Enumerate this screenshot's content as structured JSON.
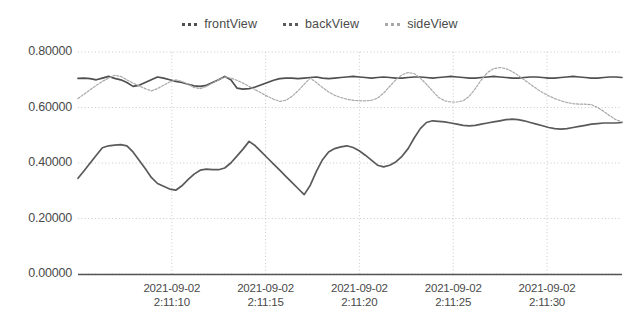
{
  "chart_data": {
    "type": "line",
    "title": "",
    "xlabel": "",
    "ylabel": "",
    "ylim": [
      0.0,
      0.8
    ],
    "grid": true,
    "legend_position": "top-center",
    "ytick_labels": [
      "0.80000",
      "0.60000",
      "0.40000",
      "0.20000",
      "0.00000"
    ],
    "ytick_values": [
      0.8,
      0.6,
      0.4,
      0.2,
      0.0
    ],
    "xtick_labels": [
      {
        "date": "2021-09-02",
        "time": "2:11:10"
      },
      {
        "date": "2021-09-02",
        "time": "2:11:15"
      },
      {
        "date": "2021-09-02",
        "time": "2:11:20"
      },
      {
        "date": "2021-09-02",
        "time": "2:11:25"
      },
      {
        "date": "2021-09-02",
        "time": "2:11:30"
      }
    ],
    "xtick_values": [
      5,
      10,
      15,
      20,
      25
    ],
    "xlim": [
      0,
      29
    ],
    "series": [
      {
        "name": "frontView",
        "color": "#4f4f4f",
        "values": [
          0.705,
          0.706,
          0.704,
          0.7,
          0.706,
          0.712,
          0.705,
          0.7,
          0.69,
          0.676,
          0.68,
          0.69,
          0.7,
          0.71,
          0.706,
          0.7,
          0.694,
          0.69,
          0.684,
          0.678,
          0.676,
          0.68,
          0.69,
          0.7,
          0.712,
          0.7,
          0.67,
          0.666,
          0.668,
          0.674,
          0.682,
          0.69,
          0.698,
          0.704,
          0.706,
          0.706,
          0.704,
          0.706,
          0.708,
          0.71,
          0.706,
          0.704,
          0.706,
          0.708,
          0.71,
          0.712,
          0.71,
          0.708,
          0.706,
          0.708,
          0.71,
          0.708,
          0.706,
          0.706,
          0.708,
          0.71,
          0.71,
          0.708,
          0.706,
          0.708
        ]
      },
      {
        "name": "backView",
        "color": "#5a5a5a",
        "values": [
          0.345,
          0.372,
          0.4,
          0.428,
          0.455,
          0.462,
          0.464,
          0.466,
          0.462,
          0.44,
          0.41,
          0.38,
          0.348,
          0.326,
          0.316,
          0.306,
          0.302,
          0.318,
          0.34,
          0.36,
          0.374,
          0.378,
          0.376,
          0.376,
          0.382,
          0.4,
          0.425,
          0.45,
          0.478,
          0.462,
          0.44,
          0.418,
          0.396,
          0.374,
          0.352,
          0.33,
          0.308,
          0.286,
          0.32,
          0.37,
          0.412,
          0.44,
          0.452,
          0.458,
          0.462,
          0.456,
          0.444,
          0.428,
          0.41,
          0.392,
          0.386,
          0.392,
          0.404,
          0.424,
          0.452,
          0.49,
          0.524,
          0.546,
          0.552,
          0.55
        ]
      },
      {
        "name": "sideView",
        "color": "#a8a8a8",
        "values": [
          0.632,
          0.648,
          0.664,
          0.68,
          0.694,
          0.706,
          0.716,
          0.712,
          0.7,
          0.688,
          0.678,
          0.668,
          0.66,
          0.668,
          0.68,
          0.692,
          0.7,
          0.694,
          0.684,
          0.672,
          0.668,
          0.676,
          0.688,
          0.7,
          0.71,
          0.706,
          0.698,
          0.688,
          0.676,
          0.664,
          0.652,
          0.64,
          0.63,
          0.622,
          0.626,
          0.64,
          0.66,
          0.684,
          0.706,
          0.69,
          0.672,
          0.656,
          0.644,
          0.636,
          0.63,
          0.626,
          0.624,
          0.624,
          0.626,
          0.634,
          0.652,
          0.676,
          0.7,
          0.718,
          0.726,
          0.722,
          0.706,
          0.684,
          0.66,
          0.636
        ]
      }
    ],
    "series_tail": {
      "note": "second half continuation",
      "frontView": [
        0.71,
        0.712,
        0.71,
        0.708,
        0.706,
        0.706,
        0.708,
        0.71,
        0.712,
        0.71,
        0.708,
        0.706,
        0.706,
        0.708,
        0.71,
        0.71,
        0.708,
        0.706,
        0.706,
        0.708,
        0.71,
        0.712,
        0.71,
        0.708,
        0.706,
        0.706,
        0.708,
        0.71,
        0.71,
        0.708
      ],
      "backView": [
        0.548,
        0.544,
        0.54,
        0.536,
        0.534,
        0.536,
        0.54,
        0.544,
        0.548,
        0.552,
        0.556,
        0.558,
        0.556,
        0.552,
        0.546,
        0.54,
        0.534,
        0.528,
        0.524,
        0.522,
        0.524,
        0.528,
        0.532,
        0.536,
        0.54,
        0.542,
        0.544,
        0.544,
        0.544,
        0.546
      ],
      "sideView": [
        0.624,
        0.62,
        0.62,
        0.624,
        0.64,
        0.668,
        0.7,
        0.726,
        0.74,
        0.744,
        0.74,
        0.73,
        0.716,
        0.7,
        0.684,
        0.668,
        0.654,
        0.642,
        0.632,
        0.624,
        0.618,
        0.614,
        0.612,
        0.612,
        0.61,
        0.6,
        0.586,
        0.57,
        0.556,
        0.548
      ]
    }
  }
}
